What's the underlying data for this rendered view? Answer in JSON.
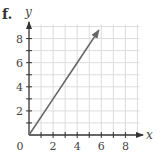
{
  "figure": {
    "part_label": "f.",
    "colors": {
      "grid": "#dcdcdc",
      "axis": "#333333",
      "line": "#666666",
      "text": "#444444"
    }
  },
  "chart_data": {
    "type": "line",
    "title": "",
    "xlabel": "x",
    "ylabel": "y",
    "xlim": [
      0,
      9
    ],
    "ylim": [
      0,
      9
    ],
    "grid": true,
    "x_ticks": [
      0,
      2,
      4,
      6,
      8
    ],
    "y_ticks": [
      2,
      4,
      6,
      8
    ],
    "x_tick_labels": [
      "0",
      "2",
      "4",
      "6",
      "8"
    ],
    "y_tick_labels": [
      "2",
      "4",
      "6",
      "8"
    ],
    "series": [
      {
        "name": "ray",
        "description": "ray from origin with arrow, y = 1.5x",
        "x": [
          0,
          2,
          4,
          5.8
        ],
        "y": [
          0,
          3,
          6,
          8.7
        ]
      }
    ]
  }
}
